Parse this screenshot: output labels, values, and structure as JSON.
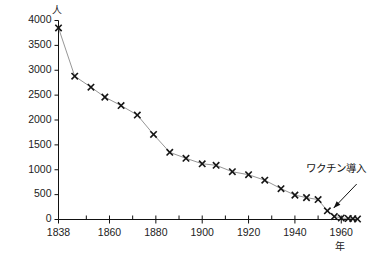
{
  "chart_data": {
    "type": "line",
    "title": "",
    "subtitle": "",
    "xlabel": "年",
    "ylabel": "人",
    "xlim": [
      1838,
      1967
    ],
    "ylim": [
      0,
      4000
    ],
    "grid": false,
    "legend": "none",
    "marker": "x",
    "y_ticks": [
      0,
      500,
      1000,
      1500,
      2000,
      2500,
      3000,
      3500,
      4000
    ],
    "y_tick_labels": [
      "0",
      "500",
      "1000",
      "1500",
      "2000",
      "2500",
      "3000",
      "3500",
      "4000"
    ],
    "x_ticks": [
      1838,
      1860,
      1880,
      1900,
      1920,
      1940,
      1960
    ],
    "x_tick_labels": [
      "1838",
      "1860",
      "1880",
      "1900",
      "1920",
      "1940",
      "1960"
    ],
    "x_minor_ticks": [
      1850,
      1870,
      1890,
      1910,
      1930,
      1950
    ],
    "series": [
      {
        "name": "死亡者数",
        "x": [
          1838,
          1845,
          1852,
          1858,
          1865,
          1872,
          1879,
          1886,
          1893,
          1900,
          1906,
          1913,
          1920,
          1927,
          1934,
          1940,
          1945,
          1950,
          1954,
          1957,
          1960,
          1963,
          1965,
          1967
        ],
        "values": [
          3850,
          2880,
          2660,
          2460,
          2290,
          2100,
          1710,
          1350,
          1230,
          1120,
          1090,
          960,
          900,
          790,
          620,
          490,
          440,
          400,
          175,
          60,
          30,
          20,
          15,
          10
        ]
      }
    ],
    "annotations": [
      {
        "text": "ワクチン導入",
        "target_x": 1955,
        "target_y": 150
      }
    ]
  }
}
